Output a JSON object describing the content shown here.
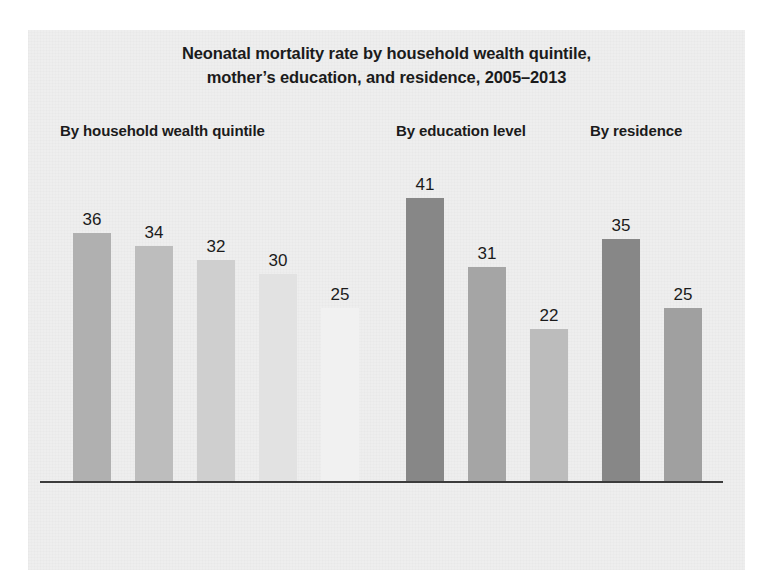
{
  "chart_data": {
    "type": "bar",
    "title": "Neonatal mortality rate by household wealth quintile, mother’s education, and residence, 2005–2013",
    "title_line_1": "Neonatal mortality rate by household wealth quintile,",
    "title_line_2": "mother’s education, and residence, 2005–2013",
    "xlabel": "",
    "ylabel": "",
    "ylim": [
      0,
      41
    ],
    "grid": false,
    "legend": "none",
    "categories": [
      "Lowest",
      "Second",
      "Middle",
      "Fourth",
      "Highest",
      "No education",
      "Primary",
      "Secondary or higher",
      "Rural",
      "Urban"
    ],
    "values": [
      36,
      34,
      32,
      30,
      25,
      41,
      31,
      22,
      35,
      25
    ],
    "groups": [
      {
        "heading": "By household wealth quintile",
        "bars": [
          {
            "label": "Lowest",
            "label_lines": [
              "Lowest"
            ],
            "value": 36,
            "color": "#b0b0b0"
          },
          {
            "label": "Second",
            "label_lines": [
              "Second"
            ],
            "value": 34,
            "color": "#bdbdbd"
          },
          {
            "label": "Middle",
            "label_lines": [
              "Middle"
            ],
            "value": 32,
            "color": "#cfcfcf"
          },
          {
            "label": "Fourth",
            "label_lines": [
              "Fourth"
            ],
            "value": 30,
            "color": "#e2e2e2"
          },
          {
            "label": "Highest",
            "label_lines": [
              "Highest"
            ],
            "value": 25,
            "color": "#f1f1f1"
          }
        ]
      },
      {
        "heading": "By education level",
        "bars": [
          {
            "label": "No education",
            "label_lines": [
              "No",
              "education"
            ],
            "value": 41,
            "color": "#878787"
          },
          {
            "label": "Primary",
            "label_lines": [
              "Primary"
            ],
            "value": 31,
            "color": "#a5a5a5"
          },
          {
            "label": "Secondary or higher",
            "label_lines": [
              "Secondary",
              "or",
              "higher"
            ],
            "value": 22,
            "color": "#bcbcbc"
          }
        ]
      },
      {
        "heading": "By residence",
        "bars": [
          {
            "label": "Rural",
            "label_lines": [
              "Rural"
            ],
            "value": 35,
            "color": "#878787"
          },
          {
            "label": "Urban",
            "label_lines": [
              "Urban"
            ],
            "value": 25,
            "color": "#a0a0a0"
          }
        ]
      }
    ]
  }
}
